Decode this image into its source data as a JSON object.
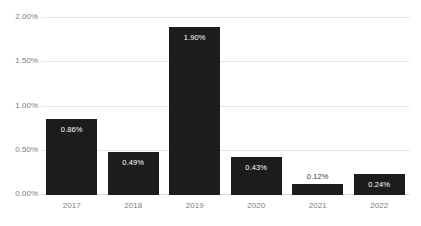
{
  "chart_data": {
    "type": "bar",
    "title": "",
    "xlabel": "",
    "ylabel": "",
    "categories": [
      "2017",
      "2018",
      "2019",
      "2020",
      "2021",
      "2022"
    ],
    "values": [
      0.86,
      0.49,
      1.9,
      0.43,
      0.12,
      0.24
    ],
    "data_labels": [
      "0.86%",
      "0.49%",
      "1.90%",
      "0.43%",
      "0.12%",
      "0.24%"
    ],
    "label_position": [
      "inside",
      "inside",
      "inside",
      "inside",
      "outside",
      "inside"
    ],
    "ylim": [
      0,
      2.0
    ],
    "yticks": [
      0,
      0.5,
      1.0,
      1.5,
      2.0
    ],
    "ytick_labels": [
      "0.00%",
      "0.50%",
      "1.00%",
      "1.50%",
      "2.00%"
    ],
    "grid": true,
    "legend": false,
    "bar_color": "#1c1c1c",
    "gridline_color": "#e8e8e8",
    "axis_text_color": "#7d7d7d",
    "background": "#ffffff"
  },
  "yaxis": {
    "ticks": [
      {
        "label": "2.00%",
        "value": 2.0
      },
      {
        "label": "1.50%",
        "value": 1.5
      },
      {
        "label": "1.00%",
        "value": 1.0
      },
      {
        "label": "0.50%",
        "value": 0.5
      },
      {
        "label": "0.00%",
        "value": 0.0
      }
    ]
  },
  "xaxis": {
    "ticks": [
      {
        "label": "2017"
      },
      {
        "label": "2018"
      },
      {
        "label": "2019"
      },
      {
        "label": "2020"
      },
      {
        "label": "2021"
      },
      {
        "label": "2022"
      }
    ]
  },
  "bars": [
    {
      "category": "2017",
      "value": 0.86,
      "label": "0.86%"
    },
    {
      "category": "2018",
      "value": 0.49,
      "label": "0.49%"
    },
    {
      "category": "2019",
      "value": 1.9,
      "label": "1.90%"
    },
    {
      "category": "2020",
      "value": 0.43,
      "label": "0.43%"
    },
    {
      "category": "2021",
      "value": 0.12,
      "label": "0.12%"
    },
    {
      "category": "2022",
      "value": 0.24,
      "label": "0.24%"
    }
  ]
}
